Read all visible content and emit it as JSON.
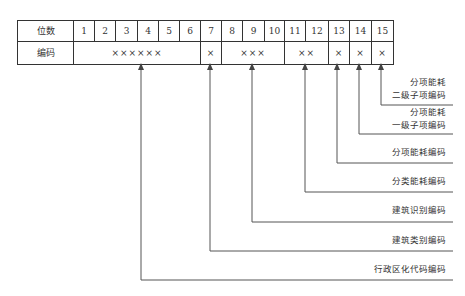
{
  "table": {
    "row_headers": [
      "位数",
      "编码"
    ],
    "positions": [
      "1",
      "2",
      "3",
      "4",
      "5",
      "6",
      "7",
      "8",
      "9",
      "10",
      "11",
      "12",
      "13",
      "14",
      "15"
    ],
    "code_groups": [
      {
        "span": 6,
        "value": "××××××"
      },
      {
        "span": 1,
        "value": "×"
      },
      {
        "span": 3,
        "value": "×××"
      },
      {
        "span": 2,
        "value": "××"
      },
      {
        "span": 1,
        "value": "×"
      },
      {
        "span": 1,
        "value": "×"
      },
      {
        "span": 1,
        "value": "×"
      }
    ]
  },
  "labels": {
    "l15_line1": "分项能耗",
    "l15_line2": "二级子项编码",
    "l14_line1": "分项能耗",
    "l14_line2": "一级子项编码",
    "l13": "分项能耗编码",
    "l11_12": "分类能耗编码",
    "l8_10": "建筑识别编码",
    "l7": "建筑类别编码",
    "l1_6": "行政区化代码编码"
  },
  "colors": {
    "line": "#555555",
    "text": "#333333",
    "background": "#ffffff"
  }
}
